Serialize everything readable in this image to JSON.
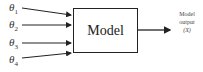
{
  "diagram": {
    "inputs": [
      {
        "symbol": "θ",
        "index": "1"
      },
      {
        "symbol": "θ",
        "index": "2"
      },
      {
        "symbol": "θ",
        "index": "3"
      },
      {
        "symbol": "θ",
        "index": "4"
      }
    ],
    "model_label": "Model",
    "output": {
      "line1": "Model",
      "line2": "output",
      "line3": "(X)"
    }
  }
}
